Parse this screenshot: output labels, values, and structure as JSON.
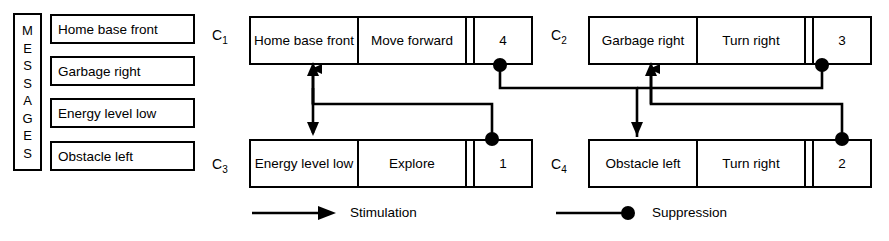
{
  "sidebar": {
    "title": "MESSAGES",
    "title_letters": [
      "M",
      "E",
      "S",
      "S",
      "A",
      "G",
      "E",
      "S"
    ],
    "messages": [
      {
        "label": "Home base front"
      },
      {
        "label": "Garbage right"
      },
      {
        "label": "Energy level low"
      },
      {
        "label": "Obstacle left"
      }
    ]
  },
  "modules": [
    {
      "id": "C1",
      "label": "C",
      "subscript": "1",
      "message": "Home base front",
      "action": "Move forward",
      "priority": "4"
    },
    {
      "id": "C2",
      "label": "C",
      "subscript": "2",
      "message": "Garbage right",
      "action": "Turn right",
      "priority": "3"
    },
    {
      "id": "C3",
      "label": "C",
      "subscript": "3",
      "message": "Energy level low",
      "action": "Explore",
      "priority": "1"
    },
    {
      "id": "C4",
      "label": "C",
      "subscript": "4",
      "message": "Obstacle left",
      "action": "Turn right",
      "priority": "2"
    }
  ],
  "legend": {
    "stimulation_label": "Stimulation",
    "suppression_label": "Suppression"
  },
  "colors": {
    "stroke": "#000000",
    "background": "#ffffff"
  },
  "connections": [
    {
      "from": "C1",
      "to": "C3",
      "type": "suppression"
    },
    {
      "from": "C3",
      "to": "C1",
      "type": "stimulation"
    },
    {
      "from": "C2",
      "to": "C4",
      "type": "suppression"
    },
    {
      "from": "C4",
      "to": "C2",
      "type": "stimulation"
    }
  ]
}
